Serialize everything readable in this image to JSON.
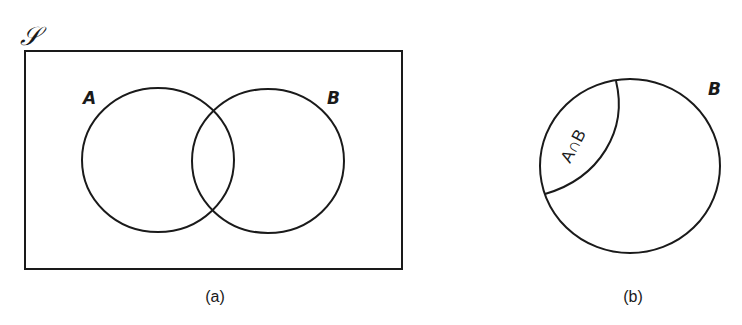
{
  "figure_a": {
    "universe_label": "𝒮",
    "set_a_label": "A",
    "set_b_label": "B",
    "caption": "(a)"
  },
  "figure_b": {
    "set_b_label": "B",
    "region_label": "A∩B",
    "caption": "(b)"
  },
  "colors": {
    "stroke": "#1a1a1a",
    "background": "#ffffff"
  }
}
